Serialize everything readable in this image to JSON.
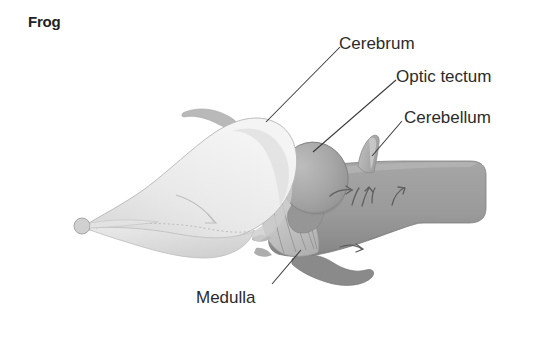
{
  "figure": {
    "title": "Frog",
    "background_color": "#ffffff"
  },
  "labels": [
    {
      "id": "cerebrum",
      "text": "Cerebrum",
      "leader_from": [
        340,
        47
      ],
      "leader_to": [
        266,
        122
      ]
    },
    {
      "id": "optic",
      "text": "Optic tectum",
      "leader_from": [
        396,
        80
      ],
      "leader_to": [
        313,
        152
      ]
    },
    {
      "id": "cerebellum",
      "text": "Cerebellum",
      "leader_from": [
        402,
        121
      ],
      "leader_to": [
        372,
        156
      ]
    },
    {
      "id": "medulla",
      "text": "Medulla",
      "leader_from": [
        272,
        284
      ],
      "leader_to": [
        301,
        250
      ]
    }
  ],
  "structures": [
    {
      "id": "olfactory-bulb",
      "name": "Olfactory bulb",
      "color": "#d9d9d9"
    },
    {
      "id": "cerebrum",
      "name": "Cerebrum",
      "color": "#ededed"
    },
    {
      "id": "optic-tectum",
      "name": "Optic tectum",
      "color": "#a8a8a8"
    },
    {
      "id": "cerebellum",
      "name": "Cerebellum",
      "color": "#b4b4b4"
    },
    {
      "id": "medulla",
      "name": "Medulla",
      "color": "#9a9a9a"
    },
    {
      "id": "spinal-cord",
      "name": "Spinal cord",
      "color": "#9a9a9a"
    },
    {
      "id": "cranial-nerves",
      "name": "Cranial nerves",
      "color": "#c6c6c6"
    },
    {
      "id": "pituitary",
      "name": "Pituitary lobe",
      "color": "#8d8d8d"
    }
  ],
  "colors": {
    "title_text": "#222222",
    "label_text": "#2b2b2b",
    "leader_line": "#3a3a3a",
    "cerebrum_fill": "#ededed",
    "cerebrum_shade": "#dedede",
    "tectum_fill": "#a8a8a8",
    "tectum_shade": "#999999",
    "cerebellum_fill": "#b4b4b4",
    "medulla_fill": "#9a9a9a",
    "medulla_shade": "#8a8a8a",
    "nerve_fill": "#c6c6c6",
    "outline": "#7d7d7d"
  }
}
